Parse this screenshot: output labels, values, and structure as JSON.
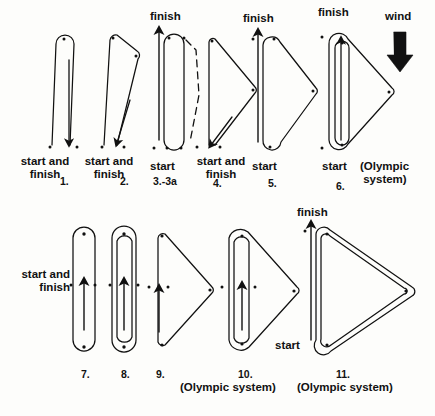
{
  "figure": {
    "title_visible": false,
    "ink_color": "#111111",
    "background": "#fdfdfb",
    "wind": {
      "label": "wind",
      "direction": "down",
      "icon": "thick-down-arrow",
      "x": 398,
      "y": 14
    }
  },
  "labels": {
    "start_and_finish": "start and\nfinish",
    "start": "start",
    "finish": "finish",
    "olympic_system": "(Olympic system)",
    "start_and_finish_line1": "start and",
    "start_and_finish_line2": "finish"
  },
  "courses": [
    {
      "number": "1.",
      "id": "course-1",
      "shape": "narrow-out-and-back-loop",
      "start_label": "start and finish",
      "finish_label": "start and finish",
      "marks": 1,
      "legs": 2,
      "olympic": false,
      "dashed_alternate": false,
      "num_x": 65,
      "num_y": 175
    },
    {
      "number": "2.",
      "id": "course-2",
      "shape": "narrow-triangle-with-short-top-leg",
      "start_label": "start and finish",
      "finish_label": "start and finish",
      "marks": 2,
      "legs": 3,
      "olympic": false,
      "dashed_alternate": false,
      "num_x": 124,
      "num_y": 175
    },
    {
      "number": "3.-3a",
      "id": "course-3",
      "shape": "narrow-loop-with-dashed-return",
      "start_label": "start",
      "finish_label": "finish",
      "marks": 2,
      "legs": 2,
      "olympic": false,
      "dashed_alternate": true,
      "num_x": 168,
      "num_y": 175
    },
    {
      "number": "4.",
      "id": "course-4",
      "shape": "triangle-pointing-right",
      "start_label": "start and finish",
      "finish_label": "start and finish",
      "marks": 3,
      "legs": 3,
      "olympic": false,
      "dashed_alternate": false,
      "num_x": 218,
      "num_y": 177
    },
    {
      "number": "5.",
      "id": "course-5",
      "shape": "triangle-with-rounded-windward-leg",
      "start_label": "start",
      "finish_label": "finish",
      "marks": 3,
      "legs": 4,
      "olympic": false,
      "dashed_alternate": false,
      "num_x": 272,
      "num_y": 177
    },
    {
      "number": "6.",
      "id": "course-6",
      "shape": "triangle-plus-double-windward-leeward-loop",
      "start_label": "start",
      "finish_label": "finish",
      "marks": 3,
      "legs": 6,
      "olympic": true,
      "dashed_alternate": false,
      "num_x": 341,
      "num_y": 180
    },
    {
      "number": "7.",
      "id": "course-7",
      "shape": "single-windward-leeward-loop",
      "start_label": "start and finish",
      "finish_label": "start and finish",
      "marks": 2,
      "legs": 2,
      "olympic": false,
      "dashed_alternate": false,
      "num_x": 86,
      "num_y": 368
    },
    {
      "number": "8.",
      "id": "course-8",
      "shape": "double-windward-leeward-loop",
      "start_label": "start and finish",
      "finish_label": "start and finish",
      "marks": 2,
      "legs": 4,
      "olympic": false,
      "dashed_alternate": false,
      "num_x": 125,
      "num_y": 368
    },
    {
      "number": "9.",
      "id": "course-9",
      "shape": "triangle-pointing-right-mid-start",
      "start_label": "start and finish",
      "finish_label": "start and finish",
      "marks": 3,
      "legs": 3,
      "olympic": false,
      "dashed_alternate": false,
      "num_x": 160,
      "num_y": 368
    },
    {
      "number": "10.",
      "id": "course-10",
      "shape": "triangle-with-double-windward-leeward-loop",
      "start_label": "start and finish",
      "finish_label": "start and finish",
      "marks": 3,
      "legs": 5,
      "olympic": true,
      "dashed_alternate": false,
      "num_x": 244,
      "num_y": 368
    },
    {
      "number": "11.",
      "id": "course-11",
      "shape": "double-lap-triangle",
      "start_label": "start",
      "finish_label": "finish",
      "marks": 3,
      "legs": 6,
      "olympic": true,
      "dashed_alternate": false,
      "num_x": 341,
      "num_y": 368
    }
  ],
  "annotations": [
    {
      "id": "ann-1",
      "text": "start and\nfinish",
      "x": 30,
      "y": 155,
      "align": "center"
    },
    {
      "id": "ann-2",
      "text": "start and\nfinish",
      "x": 93,
      "y": 155,
      "align": "center"
    },
    {
      "id": "ann-3-start",
      "text": "start",
      "x": 150,
      "y": 160,
      "align": "left"
    },
    {
      "id": "ann-3-finish",
      "text": "finish",
      "x": 150,
      "y": 8,
      "align": "left"
    },
    {
      "id": "ann-4",
      "text": "start and\nfinish",
      "x": 196,
      "y": 155,
      "align": "left"
    },
    {
      "id": "ann-5-start",
      "text": "start",
      "x": 252,
      "y": 160,
      "align": "left"
    },
    {
      "id": "ann-5-finish",
      "text": "finish",
      "x": 243,
      "y": 10,
      "align": "left"
    },
    {
      "id": "ann-6-start",
      "text": "start",
      "x": 323,
      "y": 160,
      "align": "left"
    },
    {
      "id": "ann-6-finish",
      "text": "finish",
      "x": 318,
      "y": 6,
      "align": "left"
    },
    {
      "id": "ann-6-olympic",
      "text": "(Olympic\nsystem)",
      "x": 363,
      "y": 160,
      "align": "left"
    },
    {
      "id": "ann-78-startfinish",
      "text": "start and\nfinish",
      "x": 8,
      "y": 268,
      "align": "right"
    },
    {
      "id": "ann-10-olympic",
      "text": "(Olympic system)",
      "x": 182,
      "y": 381,
      "align": "left"
    },
    {
      "id": "ann-11-olympic",
      "text": "(Olympic system)",
      "x": 300,
      "y": 381,
      "align": "left"
    },
    {
      "id": "ann-11-start",
      "text": "start",
      "x": 275,
      "y": 339,
      "align": "left"
    },
    {
      "id": "ann-11-finish",
      "text": "finish",
      "x": 299,
      "y": 206,
      "align": "left"
    }
  ]
}
